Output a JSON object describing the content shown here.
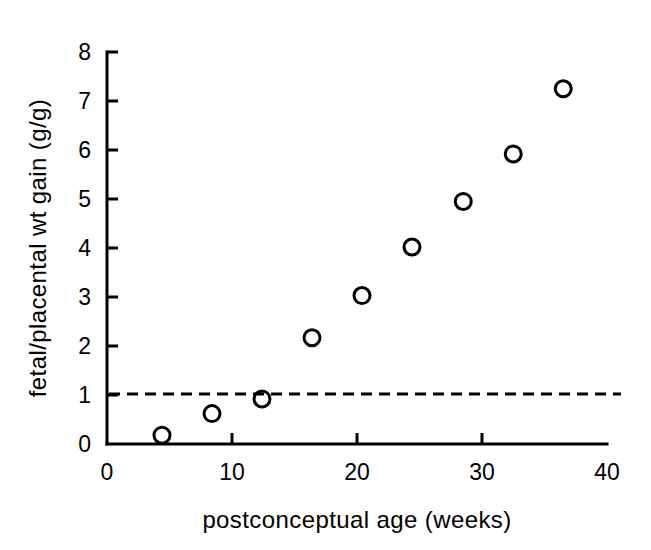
{
  "chart_data": {
    "type": "scatter",
    "title": "",
    "xlabel": "postconceptual age (weeks)",
    "ylabel": "fetal/placental wt gain (g/g)",
    "xlim": [
      0,
      40
    ],
    "ylim": [
      0,
      8
    ],
    "xticks": [
      "0",
      "10",
      "20",
      "30",
      "40"
    ],
    "xtick_values": [
      0,
      10,
      20,
      30,
      40
    ],
    "yticks": [
      "0",
      "1",
      "2",
      "3",
      "4",
      "5",
      "6",
      "7",
      "8"
    ],
    "ytick_values": [
      0,
      1,
      2,
      3,
      4,
      5,
      6,
      7,
      8
    ],
    "grid": false,
    "legend": "none",
    "marker": "open-circle",
    "series": [
      {
        "name": "fetal/placental weight gain ratio",
        "x": [
          4.4,
          8.4,
          12.4,
          16.4,
          20.4,
          24.4,
          28.5,
          32.5,
          36.5
        ],
        "y": [
          0.18,
          0.62,
          0.92,
          2.17,
          3.03,
          4.02,
          4.95,
          5.92,
          7.25
        ]
      }
    ],
    "annotations": [
      {
        "type": "horizontal-reference-line",
        "style": "dashed",
        "y": 1.02,
        "label": ""
      }
    ]
  },
  "axes": {
    "x_axis_label": "postconceptual age (weeks)",
    "y_axis_label": "fetal/placental wt gain (g/g)"
  },
  "colors": {
    "foreground": "#000000",
    "background": "#ffffff"
  }
}
